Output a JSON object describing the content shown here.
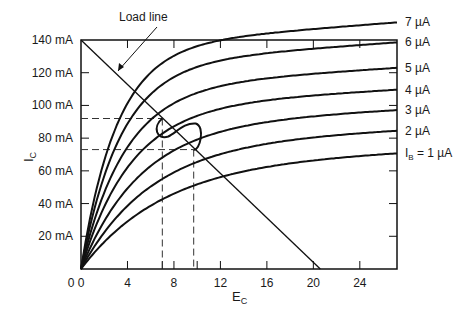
{
  "chart_data": {
    "type": "line",
    "title": "",
    "xlabel": "E",
    "xlabel_sub": "C",
    "ylabel": "I",
    "ylabel_sub": "C",
    "xlim": [
      0,
      27.2
    ],
    "ylim": [
      0,
      140
    ],
    "x_ticks": [
      0,
      4,
      8,
      12,
      16,
      20,
      24
    ],
    "x_tick_labels": [
      "0",
      "4",
      "8",
      "12",
      "16",
      "20",
      "24"
    ],
    "y_ticks": [
      20,
      40,
      60,
      80,
      100,
      120,
      140
    ],
    "y_tick_labels": [
      "20 mA",
      "40 mA",
      "60 mA",
      "80 mA",
      "100 mA",
      "120 mA",
      "140 mA"
    ],
    "grid": false,
    "series": [
      {
        "name": "IB = 1 µA",
        "label": "I_B = 1 µA",
        "saturation_mA": 65,
        "k": 0.145
      },
      {
        "name": "2 µA",
        "label": "2 µA",
        "saturation_mA": 77,
        "k": 0.17
      },
      {
        "name": "3 µA",
        "label": "3 µA",
        "saturation_mA": 88,
        "k": 0.2
      },
      {
        "name": "4 µA",
        "label": "4 µA",
        "saturation_mA": 99,
        "k": 0.24
      },
      {
        "name": "5 µA",
        "label": "5 µA",
        "saturation_mA": 111,
        "k": 0.27
      },
      {
        "name": "6 µA",
        "label": "6 µA",
        "saturation_mA": 125,
        "k": 0.3
      },
      {
        "name": "7 µA",
        "label": "7 µA",
        "saturation_mA": 136,
        "k": 0.33
      }
    ],
    "load_line": {
      "x0": 0,
      "y0": 140,
      "x1": 20.6,
      "y1": 0
    },
    "operating_swing": {
      "upper": {
        "x": 7,
        "y": 92
      },
      "lower": {
        "x": 9.7,
        "y": 73
      }
    },
    "annotations": [
      {
        "text": "Load line",
        "points_to": "load line"
      }
    ]
  },
  "labels": {
    "load_line": "Load line",
    "ylabel_main": "I",
    "ylabel_sub": "C",
    "xlabel_main": "E",
    "xlabel_sub": "C",
    "ib_prefix": "I",
    "ib_sub": "B",
    "ib_rest": " = 1 µA"
  }
}
